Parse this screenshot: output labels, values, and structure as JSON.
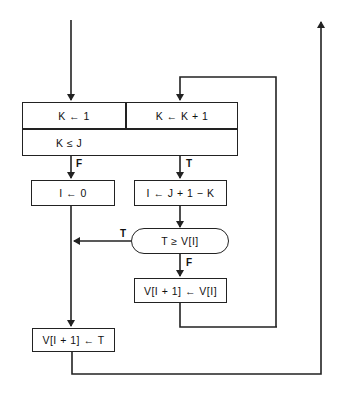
{
  "diagram": {
    "type": "flowchart",
    "init_block": {
      "init_cell": "K ← 1",
      "increment_cell": "K ← K + 1",
      "condition_cell": "K ≤ J"
    },
    "branches": {
      "loop_false_label": "F",
      "loop_true_label": "T",
      "compare_true_label": "T",
      "compare_false_label": "F"
    },
    "nodes": {
      "set_i_zero": "I ← 0",
      "set_i_index": "I ← J + 1 − K",
      "compare": "T ≥ V[I]",
      "shift": "V[I + 1] ← V[I]",
      "insert": "V[I + 1] ← T"
    },
    "colors": {
      "stroke": "#222222",
      "background": "#ffffff",
      "text": "#111111"
    }
  }
}
